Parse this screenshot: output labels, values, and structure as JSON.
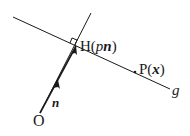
{
  "diagram": {
    "points": {
      "O": {
        "label": "O",
        "x": 40,
        "y": 115
      },
      "H": {
        "label_prefix": "H(",
        "label_p": "p",
        "label_n": "n",
        "label_suffix": ")",
        "x": 76,
        "y": 46
      },
      "P": {
        "label_prefix": "P(",
        "label_x": "x",
        "label_suffix": ")",
        "x": 136,
        "y": 73
      }
    },
    "vector_label": "n",
    "line_label": "g",
    "colors": {
      "stroke": "#1a1a1a",
      "background": "#ffffff"
    }
  }
}
